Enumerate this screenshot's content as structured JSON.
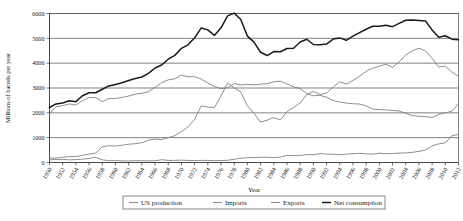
{
  "chart_data": {
    "type": "line",
    "title": "",
    "xlabel": "Year",
    "ylabel": "Millions of barrels per year",
    "xlim": [
      1950,
      2012
    ],
    "ylim": [
      0,
      6000
    ],
    "grid": true,
    "legend_position": "bottom",
    "y_ticks": [
      0,
      1000,
      2000,
      3000,
      4000,
      5000,
      6000
    ],
    "x_ticks": [
      1950,
      1952,
      1954,
      1956,
      1958,
      1960,
      1962,
      1964,
      1966,
      1968,
      1970,
      1972,
      1974,
      1976,
      1978,
      1980,
      1982,
      1984,
      1986,
      1988,
      1990,
      1992,
      1994,
      1996,
      1998,
      2000,
      2002,
      2004,
      2006,
      2008,
      2010,
      2012
    ],
    "x": [
      1950,
      1951,
      1952,
      1953,
      1954,
      1955,
      1956,
      1957,
      1958,
      1959,
      1960,
      1961,
      1962,
      1963,
      1964,
      1965,
      1966,
      1967,
      1968,
      1969,
      1970,
      1971,
      1972,
      1973,
      1974,
      1975,
      1976,
      1977,
      1978,
      1979,
      1980,
      1981,
      1982,
      1983,
      1984,
      1985,
      1986,
      1987,
      1988,
      1989,
      1990,
      1991,
      1992,
      1993,
      1994,
      1995,
      1996,
      1997,
      1998,
      1999,
      2000,
      2001,
      2002,
      2003,
      2004,
      2005,
      2006,
      2007,
      2008,
      2009,
      2010,
      2011,
      2012
    ],
    "series": [
      {
        "name": "US production",
        "color": "#808080",
        "width": 0.9,
        "values": [
          1974,
          2247,
          2290,
          2357,
          2315,
          2484,
          2617,
          2617,
          2449,
          2575,
          2575,
          2622,
          2676,
          2753,
          2787,
          2849,
          3028,
          3216,
          3329,
          3372,
          3517,
          3454,
          3455,
          3361,
          3203,
          3057,
          2976,
          3009,
          3178,
          3121,
          3147,
          3129,
          3157,
          3171,
          3250,
          3274,
          3168,
          3047,
          2979,
          2778,
          2685,
          2707,
          2625,
          2499,
          2431,
          2394,
          2366,
          2355,
          2282,
          2147,
          2131,
          2118,
          2097,
          2073,
          1983,
          1890,
          1862,
          1848,
          1812,
          1939,
          2001,
          2065,
          2375
        ]
      },
      {
        "name": "Imports",
        "color": "#808080",
        "width": 0.9,
        "values": [
          178,
          179,
          209,
          236,
          239,
          285,
          341,
          381,
          632,
          675,
          664,
          697,
          735,
          758,
          797,
          901,
          944,
          925,
          1003,
          1076,
          1248,
          1433,
          1735,
          2283,
          2233,
          2210,
          2676,
          3203,
          3009,
          2840,
          2285,
          1978,
          1626,
          1704,
          1809,
          1714,
          2044,
          2222,
          2398,
          2740,
          2862,
          2741,
          2791,
          3043,
          3245,
          3156,
          3303,
          3473,
          3675,
          3795,
          3876,
          3957,
          3831,
          4047,
          4331,
          4500,
          4603,
          4493,
          4197,
          3839,
          3885,
          3642,
          3467
        ]
      },
      {
        "name": "Exports",
        "color": "#808080",
        "width": 0.9,
        "values": [
          110,
          118,
          123,
          108,
          116,
          134,
          161,
          211,
          107,
          75,
          74,
          67,
          60,
          76,
          70,
          69,
          67,
          113,
          83,
          85,
          95,
          82,
          80,
          84,
          82,
          76,
          81,
          88,
          132,
          172,
          194,
          200,
          214,
          215,
          197,
          215,
          286,
          276,
          285,
          313,
          315,
          359,
          340,
          333,
          316,
          337,
          353,
          369,
          348,
          338,
          376,
          353,
          358,
          380,
          385,
          409,
          448,
          500,
          669,
          750,
          789,
          1077,
          1131
        ]
      },
      {
        "name": "Net consumption",
        "color": "#1a1a1a",
        "width": 1.5,
        "values": [
          2214,
          2358,
          2395,
          2486,
          2449,
          2690,
          2807,
          2809,
          2950,
          3084,
          3145,
          3209,
          3299,
          3384,
          3442,
          3587,
          3806,
          3927,
          4159,
          4314,
          4599,
          4738,
          5020,
          5419,
          5340,
          5116,
          5423,
          5902,
          6016,
          5757,
          5089,
          4848,
          4441,
          4308,
          4469,
          4458,
          4592,
          4601,
          4852,
          4962,
          4753,
          4738,
          4768,
          4970,
          5018,
          4922,
          5086,
          5231,
          5367,
          5485,
          5491,
          5528,
          5470,
          5600,
          5730,
          5735,
          5720,
          5700,
          5340,
          5040,
          5105,
          4965,
          4940
        ]
      }
    ]
  },
  "legend": {
    "items": [
      {
        "label": "US production"
      },
      {
        "label": "Imports"
      },
      {
        "label": "Exports"
      },
      {
        "label": "Net consumption"
      }
    ]
  },
  "axes": {
    "y_title": "Millions of barrels per year",
    "x_title": "Year"
  }
}
